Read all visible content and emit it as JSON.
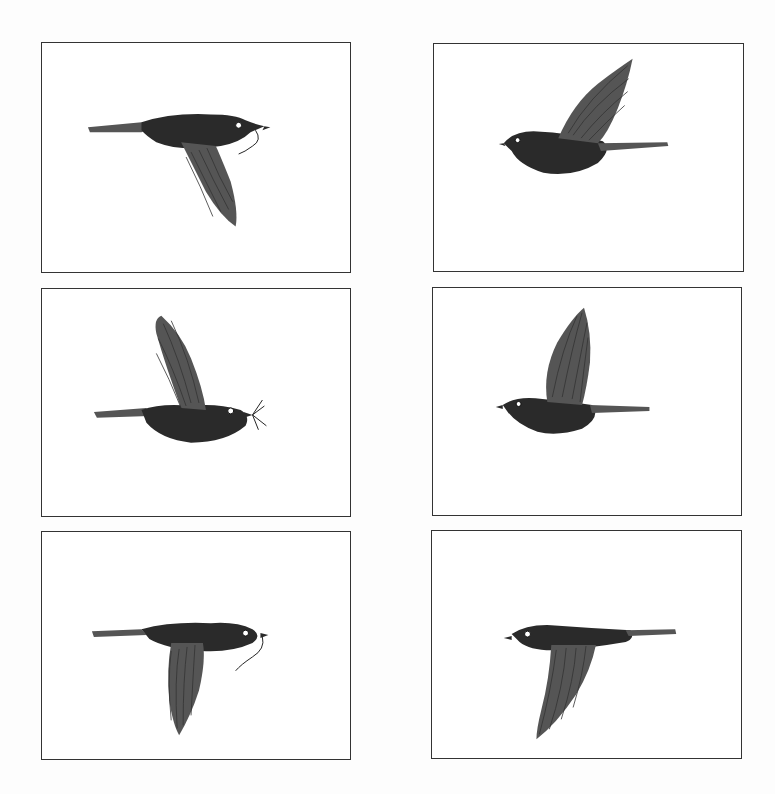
{
  "page": {
    "title": "",
    "background": "#ffffff",
    "frame_color": "#333333"
  },
  "panels": [
    {
      "id": 1,
      "subject": "bird in flight, facing right, wing down, carrying worm"
    },
    {
      "id": 2,
      "subject": "bird in flight, facing left, wing raised"
    },
    {
      "id": 3,
      "subject": "bird in flight, facing right, wing raised, carrying insect"
    },
    {
      "id": 4,
      "subject": "bird in flight, facing left, wing raised high"
    },
    {
      "id": 5,
      "subject": "bird in flight, facing right, wing down, carrying worm"
    },
    {
      "id": 6,
      "subject": "bird in flight, facing left, wing down"
    }
  ]
}
